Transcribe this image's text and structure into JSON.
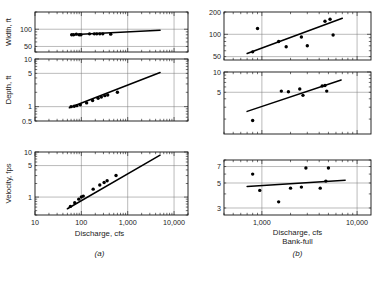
{
  "figure": {
    "panel_a_label": "(a)",
    "panel_b_label": "(b)",
    "xaxis_label": "Discharge, cfs",
    "xaxis_label_b_line2": "Bank-full"
  },
  "chart_data": [
    {
      "type": "scatter",
      "id": "a-width",
      "title": "",
      "xlabel": "Discharge, cfs",
      "ylabel": "Width, ft",
      "xlim": [
        10,
        20000
      ],
      "ylim": [
        40,
        200
      ],
      "xscale": "log",
      "yscale": "log",
      "xticklabels": [
        "10",
        "100",
        "1,000",
        "10,000"
      ],
      "xtickvalues": [
        10,
        100,
        1000,
        10000
      ],
      "yticklabels": [
        "100",
        "50"
      ],
      "ytickvalues": [
        100,
        50
      ],
      "grid": true,
      "points": [
        {
          "x": 62,
          "y": 80
        },
        {
          "x": 68,
          "y": 80
        },
        {
          "x": 78,
          "y": 82
        },
        {
          "x": 90,
          "y": 80
        },
        {
          "x": 98,
          "y": 80
        },
        {
          "x": 150,
          "y": 83
        },
        {
          "x": 190,
          "y": 83
        },
        {
          "x": 215,
          "y": 83
        },
        {
          "x": 250,
          "y": 83
        },
        {
          "x": 290,
          "y": 83
        },
        {
          "x": 430,
          "y": 82
        }
      ],
      "fit_line": {
        "x": [
          60,
          5000
        ],
        "y": [
          80,
          96
        ]
      }
    },
    {
      "type": "scatter",
      "id": "a-depth",
      "title": "",
      "xlabel": "Discharge, cfs",
      "ylabel": "Depth, ft",
      "xlim": [
        10,
        20000
      ],
      "ylim": [
        0.5,
        10
      ],
      "xscale": "log",
      "yscale": "log",
      "xticklabels": [
        "10",
        "100",
        "1,000",
        "10,000"
      ],
      "xtickvalues": [
        10,
        100,
        1000,
        10000
      ],
      "yticklabels": [
        "10",
        "5",
        "1",
        "0.5"
      ],
      "ytickvalues": [
        10,
        5,
        1,
        0.5
      ],
      "grid": true,
      "points": [
        {
          "x": 60,
          "y": 1.0
        },
        {
          "x": 70,
          "y": 1.02
        },
        {
          "x": 80,
          "y": 1.05
        },
        {
          "x": 95,
          "y": 1.1
        },
        {
          "x": 130,
          "y": 1.2
        },
        {
          "x": 175,
          "y": 1.35
        },
        {
          "x": 230,
          "y": 1.5
        },
        {
          "x": 270,
          "y": 1.6
        },
        {
          "x": 320,
          "y": 1.7
        },
        {
          "x": 370,
          "y": 1.75
        },
        {
          "x": 600,
          "y": 2.0
        }
      ],
      "fit_line": {
        "x": [
          55,
          5000
        ],
        "y": [
          0.95,
          5.2
        ]
      }
    },
    {
      "type": "scatter",
      "id": "a-velocity",
      "title": "",
      "xlabel": "Discharge, cfs",
      "ylabel": "Velocity, fps",
      "xlim": [
        10,
        20000
      ],
      "ylim": [
        0.4,
        10
      ],
      "xscale": "log",
      "yscale": "log",
      "xticklabels": [
        "10",
        "100",
        "1,000",
        "10,000"
      ],
      "xtickvalues": [
        10,
        100,
        1000,
        10000
      ],
      "yticklabels": [
        "10",
        "5",
        "1"
      ],
      "ytickvalues": [
        10,
        5,
        1
      ],
      "grid": true,
      "points": [
        {
          "x": 58,
          "y": 0.62
        },
        {
          "x": 72,
          "y": 0.75
        },
        {
          "x": 88,
          "y": 0.9
        },
        {
          "x": 100,
          "y": 1.0
        },
        {
          "x": 110,
          "y": 1.05
        },
        {
          "x": 180,
          "y": 1.5
        },
        {
          "x": 250,
          "y": 1.85
        },
        {
          "x": 310,
          "y": 2.1
        },
        {
          "x": 360,
          "y": 2.3
        },
        {
          "x": 560,
          "y": 3.0
        }
      ],
      "fit_line": {
        "x": [
          50,
          5000
        ],
        "y": [
          0.55,
          8.5
        ]
      }
    },
    {
      "type": "scatter",
      "id": "b-width",
      "title": "",
      "xlabel": "Discharge, cfs Bank-full",
      "ylabel": "Width, ft",
      "xlim": [
        400,
        14000
      ],
      "ylim": [
        45,
        200
      ],
      "xscale": "log",
      "yscale": "log",
      "xticklabels": [
        "1,000",
        "10,000"
      ],
      "xtickvalues": [
        1000,
        10000
      ],
      "yticklabels": [
        "200",
        "100",
        "50"
      ],
      "ytickvalues": [
        200,
        100,
        50
      ],
      "grid": true,
      "points": [
        {
          "x": 800,
          "y": 58
        },
        {
          "x": 900,
          "y": 120
        },
        {
          "x": 1500,
          "y": 80
        },
        {
          "x": 1800,
          "y": 68
        },
        {
          "x": 2600,
          "y": 92
        },
        {
          "x": 3000,
          "y": 70
        },
        {
          "x": 4600,
          "y": 150
        },
        {
          "x": 5200,
          "y": 160
        },
        {
          "x": 5600,
          "y": 98
        }
      ],
      "fit_line": {
        "x": [
          700,
          7000
        ],
        "y": [
          55,
          165
        ]
      }
    },
    {
      "type": "scatter",
      "id": "b-depth",
      "title": "",
      "xlabel": "Discharge, cfs Bank-full",
      "ylabel": "Depth, ft",
      "xlim": [
        400,
        14000
      ],
      "ylim": [
        1.2,
        10
      ],
      "xscale": "log",
      "yscale": "log",
      "xticklabels": [
        "1,000",
        "10,000"
      ],
      "xtickvalues": [
        1000,
        10000
      ],
      "yticklabels": [
        "10",
        "5"
      ],
      "ytickvalues": [
        10,
        5
      ],
      "grid": true,
      "points": [
        {
          "x": 800,
          "y": 1.9
        },
        {
          "x": 1600,
          "y": 5.2
        },
        {
          "x": 1900,
          "y": 5.1
        },
        {
          "x": 2500,
          "y": 5.6
        },
        {
          "x": 2700,
          "y": 4.5
        },
        {
          "x": 4300,
          "y": 6.2
        },
        {
          "x": 4600,
          "y": 6.3
        },
        {
          "x": 4800,
          "y": 5.2
        }
      ],
      "fit_line": {
        "x": [
          700,
          6800
        ],
        "y": [
          2.6,
          7.6
        ]
      }
    },
    {
      "type": "scatter",
      "id": "b-velocity",
      "title": "",
      "xlabel": "Discharge, cfs Bank-full",
      "ylabel": "Velocity, fps",
      "xlim": [
        400,
        14000
      ],
      "ylim": [
        2.6,
        8
      ],
      "xscale": "log",
      "yscale": "log",
      "xticklabels": [
        "1,000",
        "10,000"
      ],
      "xtickvalues": [
        1000,
        10000
      ],
      "yticklabels": [
        "7",
        "5",
        "3"
      ],
      "ytickvalues": [
        7,
        5,
        3
      ],
      "grid": true,
      "points": [
        {
          "x": 800,
          "y": 6.0
        },
        {
          "x": 950,
          "y": 4.3
        },
        {
          "x": 1500,
          "y": 3.4
        },
        {
          "x": 2000,
          "y": 4.5
        },
        {
          "x": 2600,
          "y": 4.6
        },
        {
          "x": 2900,
          "y": 6.8
        },
        {
          "x": 4100,
          "y": 4.5
        },
        {
          "x": 4700,
          "y": 5.2
        },
        {
          "x": 5000,
          "y": 6.8
        }
      ],
      "fit_line": {
        "x": [
          700,
          7500
        ],
        "y": [
          4.65,
          5.3
        ]
      }
    }
  ]
}
